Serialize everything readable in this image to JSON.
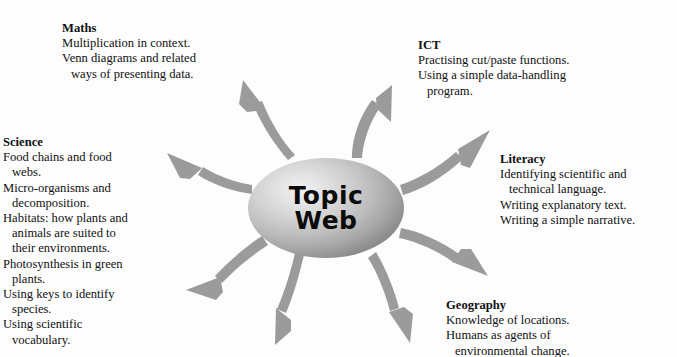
{
  "diagram": {
    "type": "topic-web-mind-map",
    "background_color": "#fdfdfd",
    "arrow_color": "#9b9b9b",
    "text_color": "#111111",
    "hub": {
      "label_line_1": "Topic",
      "label_line_2": "Web",
      "shape": "ellipse",
      "fill": "radial-gradient-grey"
    },
    "branches": [
      {
        "id": "maths",
        "heading": "Maths",
        "lines": [
          {
            "text": "Multiplication in context.",
            "indent": false
          },
          {
            "text": "Venn diagrams and related",
            "indent": false
          },
          {
            "text": "ways of presenting data.",
            "indent": true
          }
        ]
      },
      {
        "id": "ict",
        "heading": "ICT",
        "lines": [
          {
            "text": "Practising cut/paste functions.",
            "indent": false
          },
          {
            "text": "Using a simple data-handling",
            "indent": false
          },
          {
            "text": "program.",
            "indent": true
          }
        ]
      },
      {
        "id": "science",
        "heading": "Science",
        "lines": [
          {
            "text": "Food chains and food",
            "indent": false
          },
          {
            "text": "webs.",
            "indent": true
          },
          {
            "text": "Micro-organisms and",
            "indent": false
          },
          {
            "text": "decomposition.",
            "indent": true
          },
          {
            "text": "Habitats: how plants and",
            "indent": false
          },
          {
            "text": "animals are suited to",
            "indent": true
          },
          {
            "text": "their environments.",
            "indent": true
          },
          {
            "text": "Photosynthesis in green",
            "indent": false
          },
          {
            "text": "plants.",
            "indent": true
          },
          {
            "text": "Using keys to identify",
            "indent": false
          },
          {
            "text": "species.",
            "indent": true
          },
          {
            "text": "Using scientific",
            "indent": false
          },
          {
            "text": "vocabulary.",
            "indent": true
          }
        ]
      },
      {
        "id": "literacy",
        "heading": "Literacy",
        "lines": [
          {
            "text": "Identifying scientific and",
            "indent": false
          },
          {
            "text": "technical language.",
            "indent": true
          },
          {
            "text": "Writing explanatory text.",
            "indent": false
          },
          {
            "text": "Writing a simple narrative.",
            "indent": false
          }
        ]
      },
      {
        "id": "geography",
        "heading": "Geography",
        "lines": [
          {
            "text": "Knowledge of locations.",
            "indent": false
          },
          {
            "text": "Humans as agents of",
            "indent": false
          },
          {
            "text": "environmental change.",
            "indent": true
          }
        ]
      }
    ],
    "arrows": [
      {
        "id": "arrow-to-maths",
        "direction": "up-left"
      },
      {
        "id": "arrow-to-ict",
        "direction": "up-right"
      },
      {
        "id": "arrow-to-science",
        "direction": "left"
      },
      {
        "id": "arrow-to-literacy",
        "direction": "right-up"
      },
      {
        "id": "arrow-to-geography",
        "direction": "right-down"
      },
      {
        "id": "arrow-down-left",
        "direction": "down-left"
      },
      {
        "id": "arrow-down-left-outer",
        "direction": "down-left-outer"
      },
      {
        "id": "arrow-down-right",
        "direction": "down-right"
      }
    ]
  }
}
